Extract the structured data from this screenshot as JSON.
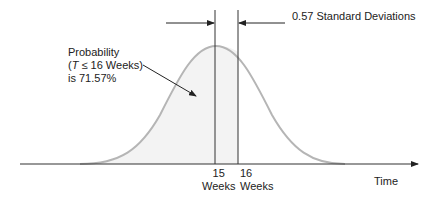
{
  "diagram": {
    "type": "normal-distribution-probability",
    "annotation": {
      "line1": "Probability",
      "line2_open": "(",
      "line2_var": "T",
      "line2_rest": " ≤ 16 Weeks)",
      "line3": "is 71.57%"
    },
    "sd_label": "0.57 Standard Deviations",
    "ticks": [
      {
        "value": "15",
        "unit": "Weeks"
      },
      {
        "value": "16",
        "unit": "Weeks"
      }
    ],
    "x_axis_label": "Time",
    "colors": {
      "curve": "#b5b5b5",
      "shade": "#f3f3f3",
      "lines": "#333333"
    }
  }
}
